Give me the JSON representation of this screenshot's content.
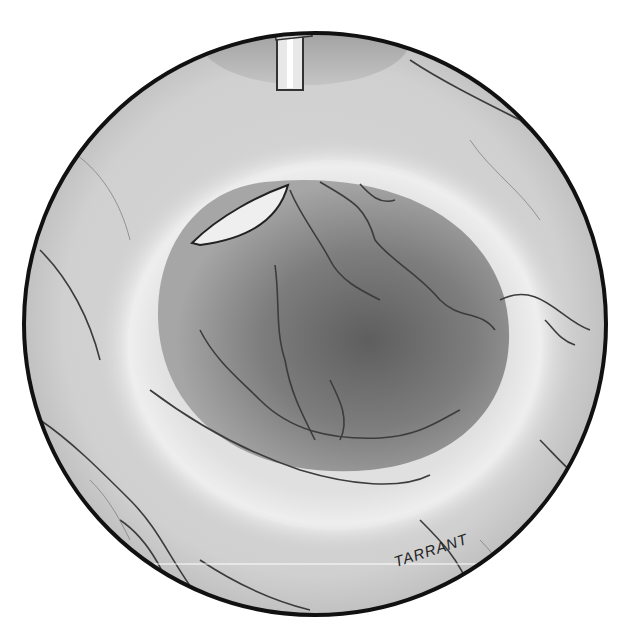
{
  "image": {
    "description": "Grayscale medical illustration of an endoscopic circular view showing a tubular lumen with vessels, an instrument tip at top and a catheter/needle tip entering at upper left",
    "signature": "TARRANT",
    "colors": {
      "frame": "#111111",
      "tissue_light": "#e6e6e6",
      "tissue_mid": "#bdbdbd",
      "lumen_dark": "#6e6e6e",
      "vessel": "#3a3a3a",
      "background": "#ffffff"
    }
  }
}
